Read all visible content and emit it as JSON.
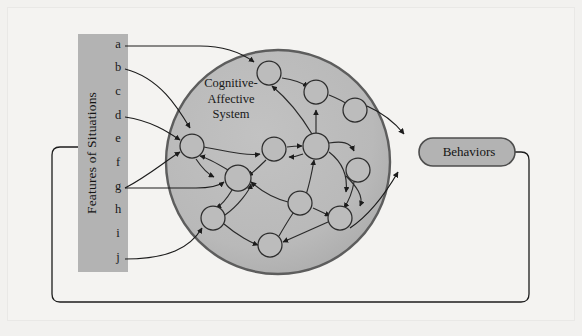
{
  "diagram": {
    "background_color": "#f4f3f1",
    "panel_fill": "#b3b3b3",
    "circle_fill": "#b8b8b8",
    "circle_stroke": "#5a5a5a",
    "node_fill": "#b8b8b8",
    "node_stroke": "#2d2d2d",
    "line_color": "#1c1c1c",
    "pill_fill": "#b3b3b3",
    "pill_stroke": "#4d4d4d"
  },
  "features_panel": {
    "label": "Features of Situations",
    "items": [
      {
        "letter": "a",
        "y": 45,
        "has_arrow": true
      },
      {
        "letter": "b",
        "y": 68,
        "has_arrow": true
      },
      {
        "letter": "c",
        "y": 92,
        "has_arrow": false
      },
      {
        "letter": "d",
        "y": 116,
        "has_arrow": true
      },
      {
        "letter": "e",
        "y": 139,
        "has_arrow": false
      },
      {
        "letter": "f",
        "y": 163,
        "has_arrow": false
      },
      {
        "letter": "g",
        "y": 187,
        "has_arrow": true
      },
      {
        "letter": "h",
        "y": 210,
        "has_arrow": false
      },
      {
        "letter": "i",
        "y": 234,
        "has_arrow": false
      },
      {
        "letter": "j",
        "y": 258,
        "has_arrow": true
      }
    ]
  },
  "cognitive_affective_system": {
    "title_line1": "Cognitive-",
    "title_line2": "Affective",
    "title_line3": "System",
    "center_x": 278,
    "center_y": 162,
    "radius": 112,
    "nodes": [
      {
        "id": "n1",
        "cx": 192,
        "cy": 146,
        "r": 12
      },
      {
        "id": "n2",
        "cx": 269,
        "cy": 73,
        "r": 12
      },
      {
        "id": "n3",
        "cx": 316,
        "cy": 92,
        "r": 12
      },
      {
        "id": "n4",
        "cx": 355,
        "cy": 110,
        "r": 12
      },
      {
        "id": "n5",
        "cx": 274,
        "cy": 149,
        "r": 12
      },
      {
        "id": "n6",
        "cx": 316,
        "cy": 146,
        "r": 12
      },
      {
        "id": "n7",
        "cx": 238,
        "cy": 178,
        "r": 13
      },
      {
        "id": "n8",
        "cx": 358,
        "cy": 170,
        "r": 12
      },
      {
        "id": "n9",
        "cx": 300,
        "cy": 203,
        "r": 12
      },
      {
        "id": "n10",
        "cx": 340,
        "cy": 218,
        "r": 12
      },
      {
        "id": "n11",
        "cx": 213,
        "cy": 218,
        "r": 12
      },
      {
        "id": "n12",
        "cx": 270,
        "cy": 245,
        "r": 12
      }
    ]
  },
  "behaviors": {
    "label": "Behaviors",
    "x": 419,
    "y": 138,
    "width": 96,
    "height": 28
  },
  "feedback_loop": {
    "description": "Behaviors feeds back into Features of Situations"
  }
}
